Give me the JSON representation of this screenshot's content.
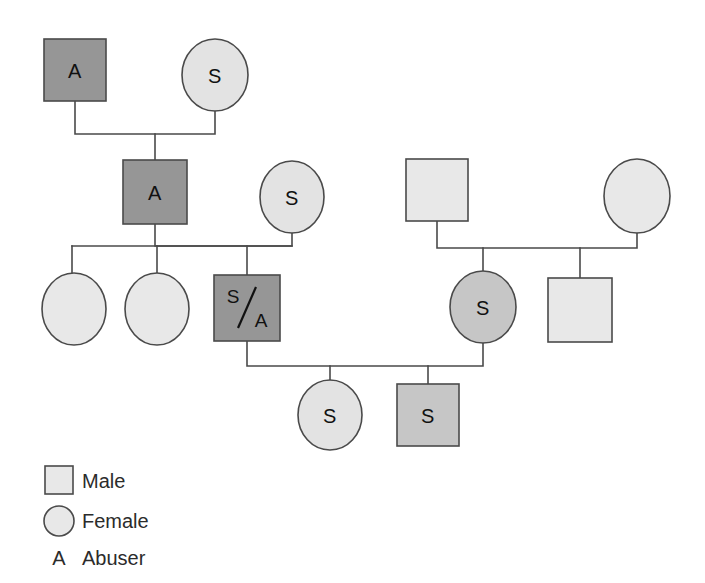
{
  "diagram": {
    "type": "genogram",
    "background_color": "#ffffff",
    "line_color": "#4a4a4a",
    "palette": {
      "dark_gray": "#969696",
      "medium_gray": "#c6c6c6",
      "light_gray": "#e3e3e3"
    },
    "generations": [
      {
        "id": "generation-1",
        "members": [
          {
            "id": "g1-male-abuser",
            "shape": "square",
            "label": "A",
            "role": "male",
            "fill": "dark_gray",
            "cx": 75,
            "cy": 70,
            "size": 62
          },
          {
            "id": "g1-female-survivor",
            "shape": "circle",
            "label": "S",
            "role": "female",
            "fill": "light_gray",
            "cx": 215,
            "cy": 75,
            "rx": 33,
            "ry": 36
          }
        ]
      },
      {
        "id": "generation-2",
        "members": [
          {
            "id": "g2-male-abuser",
            "shape": "square",
            "label": "A",
            "role": "male",
            "fill": "dark_gray",
            "cx": 155,
            "cy": 192,
            "size": 64
          },
          {
            "id": "g2-female-survivor",
            "shape": "circle",
            "label": "S",
            "role": "female",
            "fill": "light_gray",
            "cx": 292,
            "cy": 197,
            "rx": 32,
            "ry": 36
          },
          {
            "id": "g2-male-right",
            "shape": "square",
            "label": "",
            "role": "male",
            "fill": "light_gray",
            "cx": 437,
            "cy": 190,
            "size": 62
          },
          {
            "id": "g2-female-right",
            "shape": "circle",
            "label": "",
            "role": "female",
            "fill": "light_gray",
            "cx": 637,
            "cy": 196,
            "rx": 33,
            "ry": 37
          }
        ]
      },
      {
        "id": "generation-3",
        "members": [
          {
            "id": "g3-female-1",
            "shape": "circle",
            "label": "",
            "role": "female",
            "fill": "light_gray",
            "cx": 74,
            "cy": 309,
            "rx": 32,
            "ry": 36
          },
          {
            "id": "g3-female-2",
            "shape": "circle",
            "label": "",
            "role": "female",
            "fill": "light_gray",
            "cx": 157,
            "cy": 309,
            "rx": 32,
            "ry": 36
          },
          {
            "id": "g3-male-survivor-abuser",
            "shape": "square",
            "label": "S/A",
            "role": "male",
            "fill": "dark_gray",
            "cx": 247,
            "cy": 308,
            "size": 66
          },
          {
            "id": "g3-female-survivor",
            "shape": "circle",
            "label": "S",
            "role": "female",
            "fill": "medium_gray",
            "cx": 483,
            "cy": 307,
            "rx": 33,
            "ry": 36
          },
          {
            "id": "g3-male-right",
            "shape": "square",
            "label": "",
            "role": "male",
            "fill": "light_gray",
            "cx": 580,
            "cy": 310,
            "size": 64
          }
        ]
      },
      {
        "id": "generation-4",
        "members": [
          {
            "id": "g4-female-survivor",
            "shape": "circle",
            "label": "S",
            "role": "female",
            "fill": "light_gray",
            "cx": 330,
            "cy": 415,
            "rx": 32,
            "ry": 35
          },
          {
            "id": "g4-male-survivor",
            "shape": "square",
            "label": "S",
            "role": "male",
            "fill": "medium_gray",
            "cx": 428,
            "cy": 415,
            "size": 62
          }
        ]
      }
    ],
    "connections": [
      {
        "id": "union-g1",
        "type": "union-line",
        "from": "g1-male-abuser",
        "to": "g1-female-survivor",
        "bar_y": 134,
        "left_x": 75,
        "right_x": 215,
        "drop_x": 155,
        "drop_to_y": 160
      },
      {
        "id": "union-g2-left",
        "type": "union-line",
        "from": "g2-male-abuser",
        "to": "g2-female-survivor",
        "bar_y": 246,
        "left_x": 155,
        "right_x": 292
      },
      {
        "id": "sibship-g3-left",
        "type": "sibship-bar",
        "bar_y": 246,
        "left_x": 72,
        "right_x": 292,
        "child_x": [
          74,
          157,
          247
        ]
      },
      {
        "id": "union-g2-right",
        "type": "union-line",
        "from": "g2-male-right",
        "to": "g2-female-right",
        "bar_y": 248,
        "left_x": 437,
        "right_x": 637,
        "child_x": [
          483,
          580
        ]
      },
      {
        "id": "union-g3",
        "type": "union-line",
        "from": "g3-male-survivor-abuser",
        "to": "g3-female-survivor",
        "bar_y": 366,
        "left_x": 247,
        "right_x": 483,
        "child_x": [
          330,
          428
        ]
      }
    ]
  },
  "legend": {
    "id": "legend",
    "items": [
      {
        "id": "legend-male",
        "symbol": "square",
        "key": "",
        "label": "Male",
        "fill": "#e8e8e8"
      },
      {
        "id": "legend-female",
        "symbol": "circle",
        "key": "",
        "label": "Female",
        "fill": "#e8e8e8"
      },
      {
        "id": "legend-abuser",
        "symbol": "letter",
        "key": "A",
        "label": "Abuser",
        "fill": "none"
      }
    ]
  }
}
